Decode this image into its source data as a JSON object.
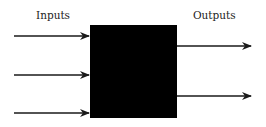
{
  "diagram": {
    "inputs_label": "Inputs",
    "outputs_label": "Outputs",
    "box": {
      "x": 90,
      "y": 25,
      "width": 87,
      "height": 93,
      "fill": "#000000"
    },
    "inputs": [
      {
        "x1": 14,
        "x2": 90,
        "y": 36
      },
      {
        "x1": 14,
        "x2": 90,
        "y": 75
      },
      {
        "x1": 14,
        "x2": 90,
        "y": 113
      }
    ],
    "outputs": [
      {
        "x1": 177,
        "x2": 251,
        "y": 46
      },
      {
        "x1": 177,
        "x2": 251,
        "y": 96
      }
    ],
    "colors": {
      "stroke": "#1a1a1a",
      "text": "#222222"
    }
  }
}
